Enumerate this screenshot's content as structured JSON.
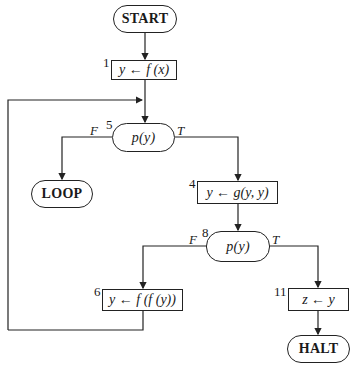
{
  "flowchart": {
    "start": {
      "label": "START"
    },
    "node1": {
      "number": "1",
      "text": "y ← f (x)"
    },
    "node5": {
      "number": "5",
      "text": "p(y)",
      "false_label": "F",
      "true_label": "T"
    },
    "loop": {
      "label": "LOOP"
    },
    "node4": {
      "number": "4",
      "text": "y ← g(y, y)"
    },
    "node8": {
      "number": "8",
      "text": "p(y)",
      "false_label": "F",
      "true_label": "T"
    },
    "node6": {
      "number": "6",
      "text": "y ← f (f (y))"
    },
    "node11": {
      "number": "11",
      "text": "z ← y"
    },
    "halt": {
      "label": "HALT"
    }
  },
  "colors": {
    "stroke": "#222222",
    "background": "#ffffff"
  }
}
